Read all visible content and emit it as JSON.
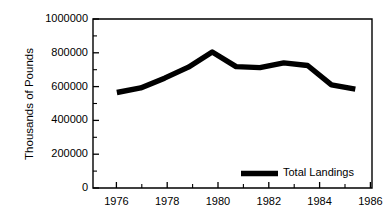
{
  "chart_data": {
    "type": "line",
    "title": "",
    "subtitle": "",
    "xlabel": "",
    "ylabel": "Thousands of Pounds",
    "x": [
      1976,
      1977,
      1978,
      1979,
      1980,
      1981,
      1982,
      1983,
      1984,
      1985,
      1986
    ],
    "series": [
      {
        "name": "Total Landings",
        "values": [
          565000,
          592000,
          650000,
          715000,
          805000,
          718000,
          712000,
          740000,
          725000,
          610000,
          585000
        ],
        "color": "#000000",
        "line_width": 5.4
      }
    ],
    "xlim": [
      1975,
      1986.7
    ],
    "ylim": [
      0,
      1000000
    ],
    "x_major_ticks": [
      1976,
      1978,
      1980,
      1982,
      1984,
      1986
    ],
    "x_minor_ticks": [
      1975,
      1977,
      1979,
      1981,
      1983,
      1985
    ],
    "x_tick_labels": [
      "1976",
      "1978",
      "1980",
      "1982",
      "1984",
      "1986"
    ],
    "y_major_ticks": [
      0,
      200000,
      400000,
      600000,
      800000,
      1000000
    ],
    "y_minor_ticks": [
      100000,
      300000,
      500000,
      700000,
      900000
    ],
    "y_tick_labels": [
      "0",
      "200000",
      "400000",
      "600000",
      "800000",
      "1000000"
    ],
    "grid": false,
    "legend_position": "inside-bottom-right",
    "legend_entries": [
      "Total Landings"
    ],
    "frame": "box"
  },
  "axes": {
    "y_axis_title": "Thousands of Pounds"
  },
  "legend": {
    "entry_label": "Total Landings"
  },
  "ticks": {
    "y": {
      "t0": "0",
      "t1": "200000",
      "t2": "400000",
      "t3": "600000",
      "t4": "800000",
      "t5": "1000000"
    },
    "x": {
      "t0": "1976",
      "t1": "1978",
      "t2": "1980",
      "t3": "1982",
      "t4": "1984",
      "t5": "1986"
    }
  }
}
